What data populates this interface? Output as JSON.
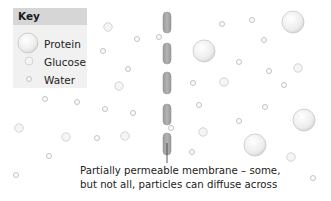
{
  "key": {
    "title": "Key",
    "items": [
      {
        "label": "Protein",
        "particle": "protein"
      },
      {
        "label": "Glucose",
        "particle": "glucose"
      },
      {
        "label": "Water",
        "particle": "water"
      }
    ]
  },
  "caption": {
    "line1": "Partially permeable membrane – some,",
    "line2": "but not all, particles can diffuse across"
  },
  "colors": {
    "membrane": "#a8a8a8",
    "key_header": "#d6d6d6",
    "key_body": "#f1f1f1",
    "particle_stroke": "#c8c8c8"
  },
  "particles": {
    "protein": [
      [
        204,
        51
      ],
      [
        293,
        22
      ],
      [
        304,
        120
      ],
      [
        255,
        145
      ]
    ],
    "glucose": [
      [
        108,
        27
      ],
      [
        119,
        86
      ],
      [
        19,
        128
      ],
      [
        66,
        137
      ],
      [
        125,
        136
      ],
      [
        298,
        68
      ],
      [
        224,
        82
      ],
      [
        203,
        132
      ],
      [
        291,
        157
      ]
    ],
    "water": [
      [
        137,
        39
      ],
      [
        159,
        37
      ],
      [
        103,
        51
      ],
      [
        128,
        69
      ],
      [
        45,
        99
      ],
      [
        77,
        102
      ],
      [
        105,
        109
      ],
      [
        133,
        113
      ],
      [
        97,
        138
      ],
      [
        49,
        156
      ],
      [
        16,
        175
      ],
      [
        222,
        24
      ],
      [
        252,
        20
      ],
      [
        264,
        40
      ],
      [
        239,
        62
      ],
      [
        269,
        71
      ],
      [
        193,
        83
      ],
      [
        284,
        85
      ],
      [
        199,
        105
      ],
      [
        265,
        107
      ],
      [
        239,
        121
      ],
      [
        171,
        128
      ],
      [
        192,
        152
      ],
      [
        313,
        178
      ]
    ]
  },
  "membrane": {
    "segments": [
      [
        12,
        33
      ],
      [
        43,
        64
      ],
      [
        72,
        94
      ],
      [
        104,
        125
      ],
      [
        133,
        155
      ]
    ]
  }
}
